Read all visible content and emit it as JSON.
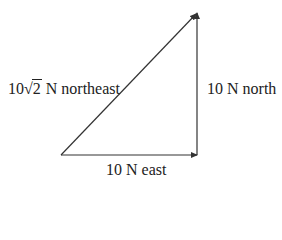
{
  "diagram": {
    "title": "",
    "vectors": [
      {
        "id": "east",
        "from": [
          0,
          0
        ],
        "to": [
          10,
          0
        ],
        "magnitude_label": "10 N east"
      },
      {
        "id": "north",
        "from": [
          10,
          0
        ],
        "to": [
          10,
          10
        ],
        "magnitude_label": "10 N north"
      },
      {
        "id": "northeast",
        "from": [
          0,
          0
        ],
        "to": [
          10,
          10
        ],
        "magnitude_label": "10√2 N northeast"
      }
    ],
    "labels": {
      "northeast": {
        "coefficient": "10",
        "radical_sign": "√",
        "radicand": "2",
        "suffix": " N northeast"
      },
      "north": "10 N north",
      "east": "10 N east"
    },
    "colors": {
      "line": "#333333",
      "text": "#222222",
      "background": "#ffffff"
    }
  }
}
